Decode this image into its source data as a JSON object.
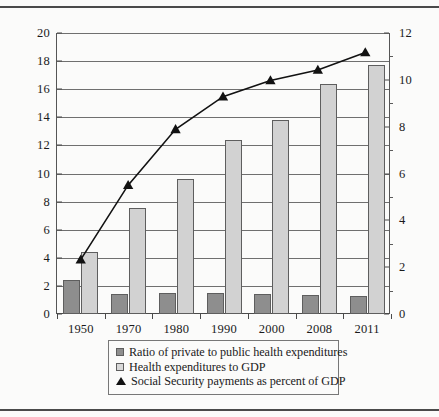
{
  "chart_data": {
    "type": "bar",
    "title": "",
    "subtitle": "",
    "xlabel": "",
    "ylabel": "",
    "categories": [
      "1950",
      "1970",
      "1980",
      "1990",
      "2000",
      "2008",
      "2011"
    ],
    "grid": true,
    "legend_position": "bottom",
    "axes": {
      "left": {
        "min": 0,
        "max": 20,
        "step": 2,
        "ticks": [
          "0",
          "2",
          "4",
          "6",
          "8",
          "10",
          "12",
          "14",
          "16",
          "18",
          "20"
        ]
      },
      "right": {
        "min": 0,
        "max": 12,
        "step": 2,
        "ticks": [
          "0",
          "2",
          "4",
          "6",
          "8",
          "10",
          "12"
        ]
      }
    },
    "series": [
      {
        "name": "Ratio of private to public health expenditures",
        "type": "bar",
        "axis": "left",
        "color": "#8e8e8e",
        "values": [
          2.4,
          1.45,
          1.5,
          1.5,
          1.45,
          1.35,
          1.3
        ]
      },
      {
        "name": "Health expenditures to GDP",
        "type": "bar",
        "axis": "left",
        "color": "#d2d2d2",
        "values": [
          4.4,
          7.55,
          9.6,
          12.35,
          13.8,
          16.4,
          17.75
        ]
      },
      {
        "name": "Social Security payments as percent of GDP",
        "type": "line",
        "axis": "right",
        "color": "#121212",
        "marker": "triangle",
        "values": [
          2.3,
          5.5,
          7.9,
          9.3,
          10.0,
          10.45,
          11.2
        ]
      }
    ]
  },
  "legend": {
    "items": [
      {
        "marker": "square-dark",
        "label": "Ratio of private to public health expenditures"
      },
      {
        "marker": "square-light",
        "label": "Health expenditures to GDP"
      },
      {
        "marker": "triangle",
        "label": "Social Security payments as percent of GDP"
      }
    ]
  }
}
